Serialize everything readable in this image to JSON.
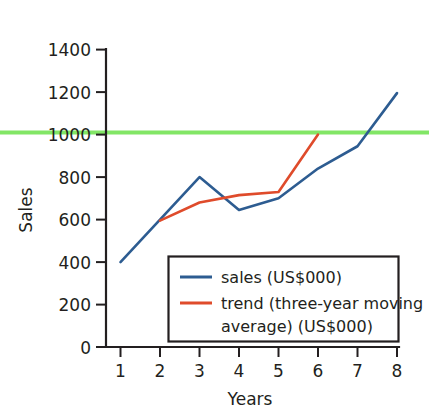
{
  "chart_data": {
    "type": "line",
    "title": "",
    "xlabel": "Years",
    "ylabel": "Sales",
    "xlim": [
      0,
      8
    ],
    "ylim": [
      0,
      1400
    ],
    "xticks": [
      "1",
      "2",
      "3",
      "4",
      "5",
      "6",
      "7",
      "8"
    ],
    "xtick_values": [
      1,
      2,
      3,
      4,
      5,
      6,
      7,
      8
    ],
    "yticks": [
      "0",
      "200",
      "400",
      "600",
      "800",
      "1000",
      "1200",
      "1400"
    ],
    "ytick_values": [
      0,
      200,
      400,
      600,
      800,
      1000,
      1200,
      1400
    ],
    "grid": false,
    "legend_position": "lower-center-right",
    "series": [
      {
        "name": "sales (US$000)",
        "color": "#2d5c91",
        "x": [
          1,
          2,
          3,
          4,
          5,
          6,
          7,
          8
        ],
        "values": [
          400,
          600,
          800,
          645,
          700,
          840,
          945,
          1195
        ]
      },
      {
        "name": "trend (three-year moving average) (US$000)",
        "color": "#df4b2b",
        "x": [
          2,
          3,
          4,
          5,
          6
        ],
        "values": [
          595,
          680,
          715,
          730,
          1000
        ]
      }
    ],
    "annotations": [
      {
        "type": "hline",
        "name": "target-threshold-line",
        "value": 1010,
        "color": "#82e666",
        "label": ""
      }
    ]
  },
  "legend": {
    "entries": [
      {
        "label": "sales (US$000)",
        "color": "#2d5c91"
      },
      {
        "label": "trend (three-year moving",
        "color": "#df4b2b"
      },
      {
        "label": "average) (US$000)",
        "color": ""
      }
    ]
  },
  "axes": {
    "y_title": "Sales",
    "x_title": "Years",
    "y_labels": [
      "1400",
      "1200",
      "1000",
      "800",
      "600",
      "400",
      "200",
      "0"
    ],
    "x_labels": [
      "1",
      "2",
      "3",
      "4",
      "5",
      "6",
      "7",
      "8"
    ]
  },
  "colors": {
    "sales": "#2d5c91",
    "trend": "#df4b2b",
    "threshold": "#82e666",
    "axis": "#231f20",
    "background": "#ffffff"
  }
}
